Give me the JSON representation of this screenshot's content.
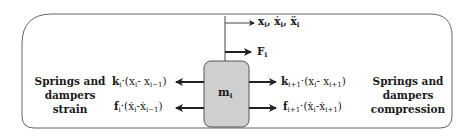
{
  "diagram": {
    "mass": {
      "symbol": "m",
      "index": "i",
      "fill": "#cfcfcf",
      "stroke": "#555555"
    },
    "top_labels": {
      "kinematics": {
        "main": "x",
        "index": "i",
        "text": "x_i, ẋ_i, ẍ_i"
      },
      "force": {
        "main": "F",
        "index": "i",
        "text": "F_i"
      }
    },
    "left": {
      "group_label_lines": [
        "Springs and",
        "dampers",
        "strain"
      ],
      "spring_term": {
        "coef": "k",
        "coef_index": "i",
        "expr": "·(x",
        "a": "i",
        "b": "i−1",
        "text": "k_i·(x_i - x_{i−1})"
      },
      "damper_term": {
        "coef": "f",
        "coef_index": "i",
        "expr": "·(ẋ",
        "a": "i",
        "b": "i−1",
        "text": "f_i·(ẋ_i - ẋ_{i−1})"
      }
    },
    "right": {
      "group_label_lines": [
        "Springs and",
        "dampers",
        "compression"
      ],
      "spring_term": {
        "coef": "k",
        "coef_index": "i+1",
        "a": "i",
        "b": "i+1",
        "text": "k_{i+1}·(x_i - x_{i+1})"
      },
      "damper_term": {
        "coef": "f",
        "coef_index": "i+1",
        "a": "i",
        "b": "i+1",
        "text": "f_{i+1}·(ẋ_i - ẋ_{i+1})"
      }
    },
    "colors": {
      "line": "#333333",
      "frame": "#555555",
      "mass_fill": "#cfcfcf"
    }
  }
}
